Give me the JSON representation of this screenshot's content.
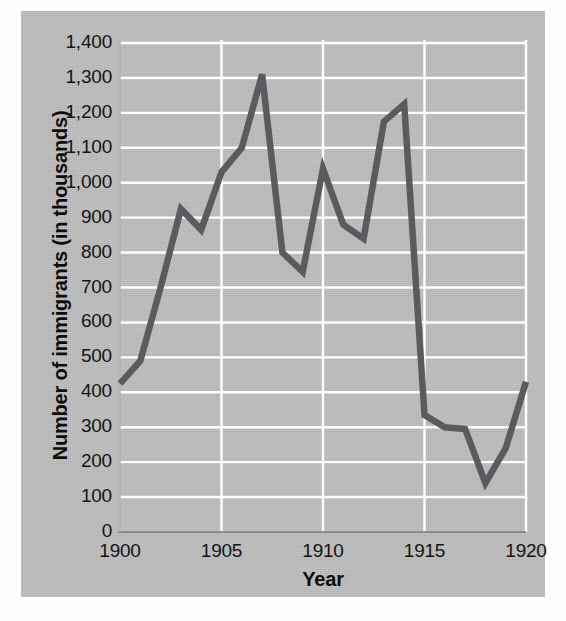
{
  "chart_data": {
    "type": "line",
    "title": "",
    "xlabel": "Year",
    "ylabel": "Number of immigrants (in thousands)",
    "xlim": [
      1900,
      1920
    ],
    "ylim": [
      0,
      1400
    ],
    "grid": true,
    "legend": "none",
    "line_color": "#5a5a5f",
    "panel_color": "#bdbdbd",
    "gridline_color": "#ffffff",
    "x_tick_labels": [
      "1900",
      "1905",
      "1910",
      "1915",
      "1920"
    ],
    "x_tick_values": [
      1900,
      1905,
      1910,
      1915,
      1920
    ],
    "y_tick_labels": [
      "0",
      "100",
      "200",
      "300",
      "400",
      "500",
      "600",
      "700",
      "800",
      "900",
      "1,000",
      "1,100",
      "1,200",
      "1,300",
      "1,400"
    ],
    "y_tick_values": [
      0,
      100,
      200,
      300,
      400,
      500,
      600,
      700,
      800,
      900,
      1000,
      1100,
      1200,
      1300,
      1400
    ],
    "x": [
      1900,
      1901,
      1902,
      1903,
      1904,
      1905,
      1906,
      1907,
      1908,
      1909,
      1910,
      1911,
      1912,
      1913,
      1914,
      1915,
      1916,
      1917,
      1918,
      1919,
      1920
    ],
    "values": [
      425,
      490,
      700,
      925,
      865,
      1030,
      1100,
      1310,
      800,
      745,
      1040,
      880,
      840,
      1175,
      1225,
      335,
      300,
      295,
      140,
      240,
      430
    ],
    "series": [
      {
        "name": "Number of immigrants",
        "values": [
          425,
          490,
          700,
          925,
          865,
          1030,
          1100,
          1310,
          800,
          745,
          1040,
          880,
          840,
          1175,
          1225,
          335,
          300,
          295,
          140,
          240,
          430
        ]
      }
    ]
  }
}
